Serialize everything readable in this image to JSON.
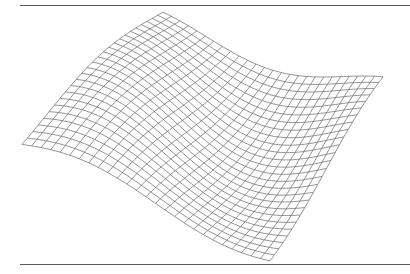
{
  "figure": {
    "type": "wireframe-surface",
    "background": "#ffffff",
    "line_color": "#707070",
    "rule_color": "#5a5a5a",
    "grid": {
      "rows": 26,
      "cols": 26,
      "samples": 60
    },
    "projection_corners": {
      "back": [
        163,
        24
      ],
      "left": [
        22,
        150
      ],
      "front": [
        270,
        250
      ],
      "right": [
        383,
        88
      ]
    },
    "surface": {
      "description": "z = A * sin(k * (u + v) + phase) sinusoidal wave surface",
      "amplitude_px": 26,
      "frequency": 1.6,
      "phase": 0.4
    }
  }
}
